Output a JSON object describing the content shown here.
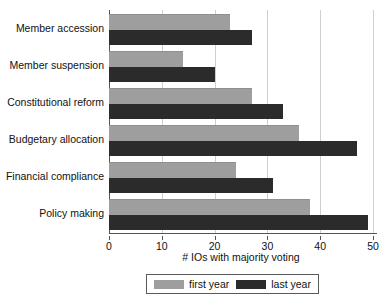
{
  "chart_data": {
    "type": "bar",
    "orientation": "horizontal",
    "title": "",
    "xlabel": "# IOs with majority voting",
    "ylabel": "",
    "xlim": [
      0,
      50
    ],
    "xticks": [
      0,
      10,
      20,
      30,
      40,
      50
    ],
    "grid": true,
    "legend_position": "bottom",
    "categories": [
      "Member accession",
      "Member suspension",
      "Constitutional reform",
      "Budgetary allocation",
      "Financial compliance",
      "Policy making"
    ],
    "series": [
      {
        "name": "first year",
        "color": "#9e9e9e",
        "values": [
          23,
          14,
          27,
          36,
          24,
          38
        ]
      },
      {
        "name": "last year",
        "color": "#2b2b2b",
        "values": [
          27,
          20,
          33,
          47,
          31,
          49
        ]
      }
    ]
  },
  "legend": {
    "items": [
      {
        "label": "first year"
      },
      {
        "label": "last year"
      }
    ]
  }
}
